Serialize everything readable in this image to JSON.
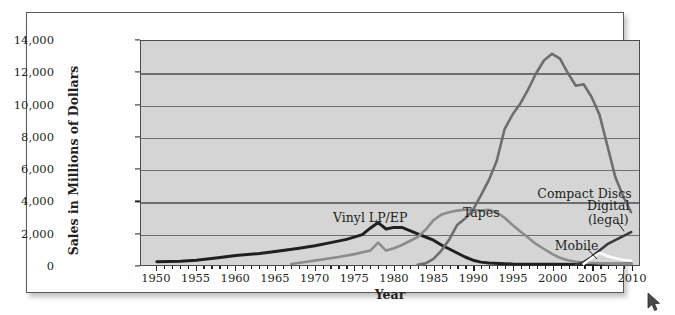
{
  "figure": {
    "background_color": "#ffffff",
    "plot_background_color": "#d5d5d5",
    "frame_border_color": "#59595b"
  },
  "chart_data": {
    "type": "line",
    "title": "",
    "xlabel": "Year",
    "ylabel": "Sales in Millions of Dollars",
    "xlim": [
      1948,
      2011
    ],
    "ylim": [
      0,
      14000
    ],
    "grid": true,
    "legend_position": "inline-annotations",
    "x_tick_labels": [
      "1950",
      "1955",
      "1960",
      "1965",
      "1970",
      "1975",
      "1980",
      "1985",
      "1990",
      "1995",
      "2000",
      "2005",
      "2010"
    ],
    "x_ticks": [
      1950,
      1955,
      1960,
      1965,
      1970,
      1975,
      1980,
      1985,
      1990,
      1995,
      2000,
      2005,
      2010
    ],
    "y_tick_labels": [
      "0",
      "2,000",
      "4,000",
      "6,000",
      "8,000",
      "10,000",
      "12,000",
      "14,000"
    ],
    "y_ticks": [
      0,
      2000,
      4000,
      6000,
      8000,
      10000,
      12000,
      14000
    ],
    "series": [
      {
        "name": "Vinyl LP/EP",
        "color": "#231f20",
        "label_text": "Vinyl LP/EP",
        "label_x": 1977,
        "label_y": 2950,
        "x": [
          1950,
          1953,
          1955,
          1958,
          1960,
          1963,
          1965,
          1968,
          1970,
          1972,
          1974,
          1976,
          1977,
          1978,
          1979,
          1980,
          1981,
          1982,
          1983,
          1984,
          1985,
          1986,
          1987,
          1988,
          1989,
          1990,
          1991,
          1992,
          1995,
          2000,
          2005,
          2010
        ],
        "y": [
          200,
          230,
          300,
          470,
          600,
          720,
          850,
          1050,
          1200,
          1400,
          1600,
          1900,
          2300,
          2650,
          2250,
          2350,
          2350,
          2150,
          1950,
          1750,
          1550,
          1250,
          1000,
          750,
          500,
          300,
          180,
          120,
          60,
          40,
          30,
          60
        ]
      },
      {
        "name": "Tapes",
        "color": "#8c8c8e",
        "label_text": "Tapes",
        "label_x": 1991,
        "label_y": 3300,
        "x": [
          1967,
          1969,
          1971,
          1973,
          1975,
          1977,
          1978,
          1979,
          1980,
          1981,
          1982,
          1983,
          1984,
          1985,
          1986,
          1987,
          1988,
          1989,
          1990,
          1991,
          1992,
          1993,
          1994,
          1995,
          1996,
          1997,
          1998,
          1999,
          2000,
          2001,
          2002,
          2003,
          2004,
          2005,
          2006,
          2008,
          2010
        ],
        "y": [
          60,
          200,
          350,
          500,
          680,
          900,
          1400,
          900,
          1050,
          1250,
          1500,
          1750,
          2200,
          2800,
          3150,
          3300,
          3400,
          3450,
          3450,
          3400,
          3450,
          3300,
          2950,
          2500,
          2100,
          1700,
          1300,
          1000,
          700,
          450,
          300,
          200,
          150,
          120,
          100,
          70,
          50
        ]
      },
      {
        "name": "Compact Discs",
        "color": "#6d6e71",
        "label_text": "Compact Discs",
        "label_x": 2004,
        "label_y": 4450,
        "x": [
          1983,
          1984,
          1985,
          1986,
          1987,
          1988,
          1989,
          1990,
          1991,
          1992,
          1993,
          1994,
          1995,
          1996,
          1997,
          1998,
          1999,
          2000,
          2001,
          2002,
          2003,
          2004,
          2005,
          2006,
          2007,
          2008,
          2009,
          2010
        ],
        "y": [
          20,
          100,
          380,
          900,
          1600,
          2500,
          2900,
          3450,
          4350,
          5300,
          6500,
          8500,
          9400,
          10100,
          11000,
          12000,
          12800,
          13200,
          12900,
          12000,
          11200,
          11300,
          10500,
          9400,
          7450,
          5500,
          4300,
          3300
        ]
      },
      {
        "name": "Digital (legal)",
        "color": "#3a3a3c",
        "label_text": "Digital\n(legal)",
        "label_x": 2007,
        "label_y": 3300,
        "x": [
          2003,
          2004,
          2005,
          2006,
          2007,
          2008,
          2009,
          2010
        ],
        "y": [
          20,
          180,
          500,
          900,
          1300,
          1550,
          1800,
          2050
        ]
      },
      {
        "name": "Mobile",
        "color": "#fdfdfd",
        "label_text": "Mobile",
        "label_x": 2003,
        "label_y": 1250,
        "x": [
          2004,
          2005,
          2006,
          2007,
          2008,
          2009,
          2010
        ],
        "y": [
          60,
          420,
          750,
          560,
          420,
          330,
          260
        ]
      }
    ]
  }
}
